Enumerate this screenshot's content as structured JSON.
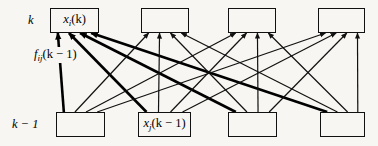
{
  "figure": {
    "background_color": "#f7f6f2",
    "line_color": "#111111",
    "emphasis_line_color": "#000000"
  },
  "row_labels": [
    {
      "id": "row-k",
      "text": "k",
      "x": 28,
      "y": 13
    },
    {
      "id": "row-k-minus-1",
      "text": "k − 1",
      "x": 12,
      "y": 117
    }
  ],
  "weight_label": {
    "id": "weight-f-ij",
    "base": "f",
    "subscript": "ij",
    "argument": "(k − 1)",
    "x": 33,
    "y": 47
  },
  "top_nodes": [
    {
      "id": "top-node-1",
      "x": 50,
      "y": 8,
      "w": 49,
      "h": 25,
      "labeled": true,
      "base": "x",
      "subscript": "i",
      "argument": "(k)"
    },
    {
      "id": "top-node-2",
      "x": 141,
      "y": 8,
      "w": 48,
      "h": 25,
      "labeled": false
    },
    {
      "id": "top-node-3",
      "x": 228,
      "y": 8,
      "w": 48,
      "h": 25,
      "labeled": false
    },
    {
      "id": "top-node-4",
      "x": 318,
      "y": 8,
      "w": 47,
      "h": 25,
      "labeled": false
    }
  ],
  "bottom_nodes": [
    {
      "id": "bottom-node-1",
      "x": 56,
      "y": 112,
      "w": 49,
      "h": 25,
      "labeled": false
    },
    {
      "id": "bottom-node-2",
      "x": 138,
      "y": 112,
      "w": 53,
      "h": 25,
      "labeled": true,
      "base": "x",
      "subscript": "j",
      "argument": "(k − 1)"
    },
    {
      "id": "bottom-node-3",
      "x": 228,
      "y": 112,
      "w": 49,
      "h": 25,
      "labeled": false
    },
    {
      "id": "bottom-node-4",
      "x": 320,
      "y": 112,
      "w": 45,
      "h": 25,
      "labeled": false
    }
  ],
  "edges": [
    {
      "id": "edge-b1-t1",
      "from": "bottom-node-1",
      "to": "top-node-1",
      "emphasis": true
    },
    {
      "id": "edge-b2-t1",
      "from": "bottom-node-2",
      "to": "top-node-1",
      "emphasis": true
    },
    {
      "id": "edge-b3-t1",
      "from": "bottom-node-3",
      "to": "top-node-1",
      "emphasis": true
    },
    {
      "id": "edge-b4-t1",
      "from": "bottom-node-4",
      "to": "top-node-1",
      "emphasis": true
    },
    {
      "id": "edge-b1-t2",
      "from": "bottom-node-1",
      "to": "top-node-2",
      "emphasis": false
    },
    {
      "id": "edge-b2-t2",
      "from": "bottom-node-2",
      "to": "top-node-2",
      "emphasis": false
    },
    {
      "id": "edge-b3-t2",
      "from": "bottom-node-3",
      "to": "top-node-2",
      "emphasis": false
    },
    {
      "id": "edge-b4-t2",
      "from": "bottom-node-4",
      "to": "top-node-2",
      "emphasis": false
    },
    {
      "id": "edge-b1-t3",
      "from": "bottom-node-1",
      "to": "top-node-3",
      "emphasis": false
    },
    {
      "id": "edge-b2-t3",
      "from": "bottom-node-2",
      "to": "top-node-3",
      "emphasis": false
    },
    {
      "id": "edge-b3-t3",
      "from": "bottom-node-3",
      "to": "top-node-3",
      "emphasis": false
    },
    {
      "id": "edge-b4-t3",
      "from": "bottom-node-4",
      "to": "top-node-3",
      "emphasis": false
    },
    {
      "id": "edge-b1-t4",
      "from": "bottom-node-1",
      "to": "top-node-4",
      "emphasis": false
    },
    {
      "id": "edge-b2-t4",
      "from": "bottom-node-2",
      "to": "top-node-4",
      "emphasis": false
    },
    {
      "id": "edge-b3-t4",
      "from": "bottom-node-3",
      "to": "top-node-4",
      "emphasis": false
    },
    {
      "id": "edge-b4-t4",
      "from": "bottom-node-4",
      "to": "top-node-4",
      "emphasis": false
    }
  ]
}
